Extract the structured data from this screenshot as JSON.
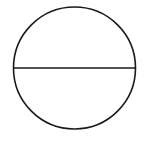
{
  "diagram": {
    "type": "circle-with-diameter",
    "background": "#ffffff",
    "stroke_color": "#1a1a1a",
    "circle": {
      "cx": 74.5,
      "cy": 68,
      "r": 61,
      "stroke_width": 1.6
    },
    "diameter": {
      "orientation": "horizontal",
      "y": 68,
      "stroke_width": 1.6
    }
  }
}
